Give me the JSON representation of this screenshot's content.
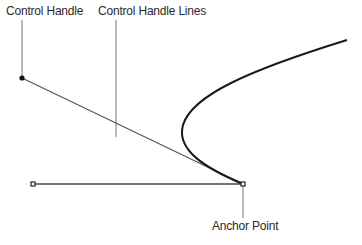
{
  "labels": {
    "control_handle": "Control Handle",
    "control_handle_lines": "Control Handle Lines",
    "anchor_point": "Anchor Point"
  },
  "colors": {
    "curve": "#1a1a1a",
    "handle_line": "#555555",
    "leader_line": "#777777",
    "text": "#2a2a2a"
  }
}
